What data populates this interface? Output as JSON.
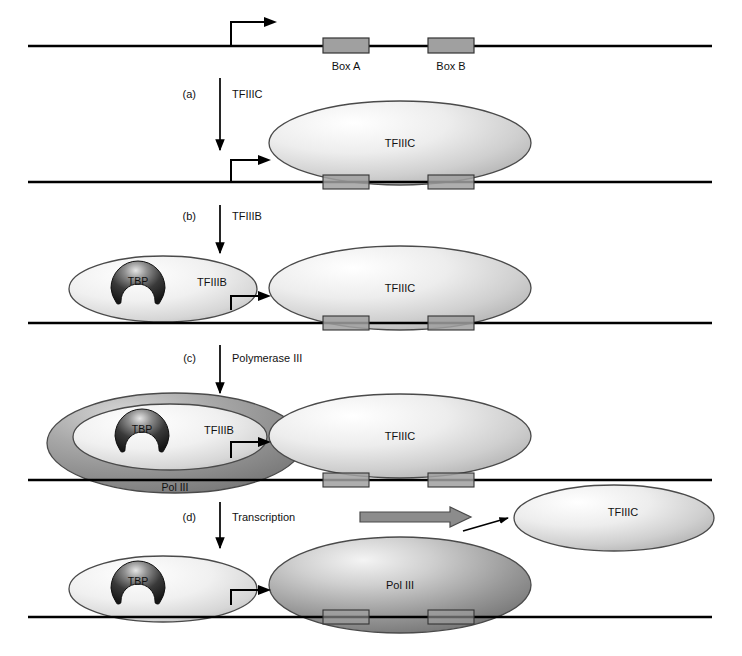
{
  "figure": {
    "width": 742,
    "height": 656
  },
  "colors": {
    "dna_line": "#000000",
    "box_fill": "#a0a0a0",
    "box_stroke": "#333333",
    "ellipse_light_a": "#ffffff",
    "ellipse_light_b": "#b4b4b4",
    "ellipse_stroke": "#4a4a4a",
    "polIII_dark_a": "#f2f2f2",
    "polIII_dark_b": "#6e6e6e",
    "tbp_dark_a": "#d8d8d8",
    "tbp_dark_b": "#1a1a1a",
    "arrow_black": "#000000",
    "block_arrow_fill": "#8c8c8c",
    "block_arrow_stroke": "#4a4a4a",
    "text": "#111111"
  },
  "promoter": {
    "box_a_label": "Box A",
    "box_b_label": "Box B",
    "start_arrow_name": "transcription-start-arrow"
  },
  "steps": [
    {
      "id": "a",
      "letter": "(a)",
      "factor": "TFIIIC"
    },
    {
      "id": "b",
      "letter": "(b)",
      "factor": "TFIIIB"
    },
    {
      "id": "c",
      "letter": "(c)",
      "factor": "Polymerase III"
    },
    {
      "id": "d",
      "letter": "(d)",
      "factor": "Transcription"
    }
  ],
  "proteins": {
    "tfiiic": "TFIIIC",
    "tfiiib": "TFIIIB",
    "tbp": "TBP",
    "pol3": "Pol III"
  },
  "panels": {
    "panel0": {
      "name": "naked-promoter-dna",
      "labels": [
        "Box A",
        "Box B"
      ]
    },
    "panel1": {
      "name": "tfiiic-bound",
      "labels": [
        "TFIIIC"
      ]
    },
    "panel2": {
      "name": "tfiiib-recruited",
      "labels": [
        "TBP",
        "TFIIIB",
        "TFIIIC"
      ]
    },
    "panel3": {
      "name": "polymerase-recruited",
      "labels": [
        "TBP",
        "TFIIIB",
        "Pol III",
        "TFIIIC"
      ]
    },
    "panel4": {
      "name": "transcribing-complex",
      "labels": [
        "TBP",
        "Pol III",
        "TFIIIC"
      ]
    }
  }
}
